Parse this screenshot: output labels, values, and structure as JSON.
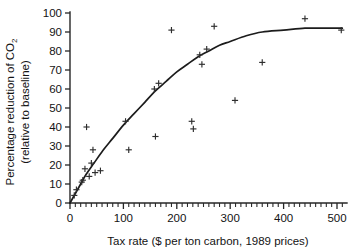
{
  "chart_data": {
    "type": "scatter",
    "title": "",
    "subtitle": "",
    "xlabel": "Tax rate ($ per ton carbon, 1989 prices)",
    "ylabel_line1": "Percentage reduction of CO",
    "ylabel_sub": "2",
    "ylabel_line2": "(relative to baseline)",
    "xlim": [
      -15,
      515
    ],
    "ylim": [
      0,
      100
    ],
    "xticks": [
      0,
      100,
      200,
      300,
      400,
      500
    ],
    "xtick_labels": [
      "0",
      "100",
      "200",
      "300",
      "400",
      "500"
    ],
    "x_minor_tick_step": 10,
    "yticks": [
      0,
      10,
      20,
      30,
      40,
      50,
      60,
      70,
      80,
      90,
      100
    ],
    "ytick_labels": [
      "0",
      "10",
      "20",
      "30",
      "40",
      "50",
      "60",
      "70",
      "80",
      "90",
      "100"
    ],
    "grid": false,
    "legend": null,
    "marker": "plus",
    "points": [
      {
        "x": 8,
        "y": 4
      },
      {
        "x": 12,
        "y": 7
      },
      {
        "x": 22,
        "y": 11
      },
      {
        "x": 24,
        "y": 12
      },
      {
        "x": 28,
        "y": 18
      },
      {
        "x": 31,
        "y": 40
      },
      {
        "x": 36,
        "y": 14
      },
      {
        "x": 40,
        "y": 21
      },
      {
        "x": 43,
        "y": 28
      },
      {
        "x": 47,
        "y": 16
      },
      {
        "x": 57,
        "y": 17
      },
      {
        "x": 104,
        "y": 43
      },
      {
        "x": 110,
        "y": 28
      },
      {
        "x": 158,
        "y": 60
      },
      {
        "x": 160,
        "y": 35
      },
      {
        "x": 166,
        "y": 63
      },
      {
        "x": 190,
        "y": 91
      },
      {
        "x": 228,
        "y": 43
      },
      {
        "x": 231,
        "y": 39
      },
      {
        "x": 243,
        "y": 78
      },
      {
        "x": 247,
        "y": 73
      },
      {
        "x": 256,
        "y": 81
      },
      {
        "x": 270,
        "y": 93
      },
      {
        "x": 309,
        "y": 54
      },
      {
        "x": 360,
        "y": 74
      },
      {
        "x": 440,
        "y": 97
      },
      {
        "x": 508,
        "y": 91
      }
    ],
    "fit_curve": {
      "description": "smooth saturating fitted curve through scatter",
      "points": [
        {
          "x": 0,
          "y": 0
        },
        {
          "x": 10,
          "y": 5
        },
        {
          "x": 20,
          "y": 10
        },
        {
          "x": 30,
          "y": 15
        },
        {
          "x": 45,
          "y": 21
        },
        {
          "x": 60,
          "y": 27
        },
        {
          "x": 80,
          "y": 34
        },
        {
          "x": 100,
          "y": 41
        },
        {
          "x": 120,
          "y": 47
        },
        {
          "x": 140,
          "y": 53
        },
        {
          "x": 160,
          "y": 59
        },
        {
          "x": 180,
          "y": 64
        },
        {
          "x": 200,
          "y": 69
        },
        {
          "x": 220,
          "y": 73
        },
        {
          "x": 240,
          "y": 77
        },
        {
          "x": 260,
          "y": 80
        },
        {
          "x": 280,
          "y": 83
        },
        {
          "x": 300,
          "y": 85
        },
        {
          "x": 330,
          "y": 88
        },
        {
          "x": 360,
          "y": 90
        },
        {
          "x": 400,
          "y": 91
        },
        {
          "x": 440,
          "y": 92
        },
        {
          "x": 470,
          "y": 92
        },
        {
          "x": 510,
          "y": 92
        }
      ]
    },
    "colors": {
      "axis": "#262626",
      "curve": "#1c1c1c",
      "marker": "#2e2e2e",
      "text": "#131313",
      "background": "#ffffff"
    }
  }
}
